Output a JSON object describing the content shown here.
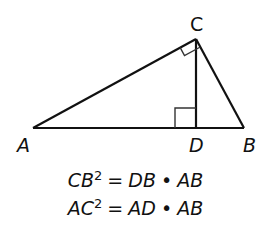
{
  "diagram": {
    "type": "right-triangle-altitude",
    "vertices": {
      "A": {
        "label": "A",
        "x": 33,
        "y": 128
      },
      "B": {
        "label": "B",
        "x": 244,
        "y": 128
      },
      "C": {
        "label": "C",
        "x": 196,
        "y": 39
      },
      "D": {
        "label": "D",
        "x": 196,
        "y": 128
      }
    },
    "right_angles": [
      "ACB",
      "CDA"
    ],
    "stroke_color": "#111111"
  },
  "equations": [
    {
      "lhs": "CB",
      "exp": "2",
      "eq": "=",
      "r1": "DB",
      "dot": "•",
      "r2": "AB"
    },
    {
      "lhs": "AC",
      "exp": "2",
      "eq": "=",
      "r1": "AD",
      "dot": "•",
      "r2": "AB"
    }
  ]
}
